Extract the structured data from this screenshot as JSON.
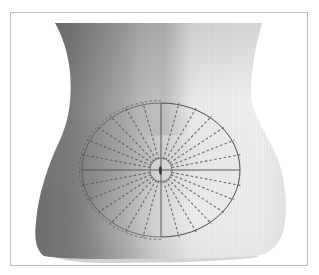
{
  "figure": {
    "caption": "Abdominal torso with elliptical radial grid centered on the umbilicus",
    "colors": {
      "background": "#ffffff",
      "frame_border": "#bdbdbd",
      "skin_shadow": "#6e6e6e",
      "skin_mid": "#a9a9a9",
      "skin_light": "#e9e9e9",
      "skin_highlight": "#f4f4f4",
      "grid_line": "#4a4a4a",
      "grid_dash": "#555555",
      "umbilicus_inner": "#1e1e1e",
      "umbilicus_ring": "#d8d8d8",
      "briefs_band": "#cfcfcf"
    },
    "grid": {
      "center_x": 161,
      "center_y": 170,
      "ellipse_rx": 79,
      "ellipse_ry": 67,
      "inner_circle_r": 11,
      "solid_axes": [
        "horizontal",
        "vertical"
      ],
      "dashed_rays_per_quadrant": 6,
      "total_divisions": 28
    }
  }
}
